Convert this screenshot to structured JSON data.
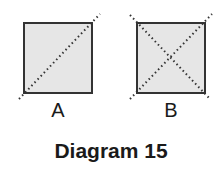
{
  "diagram": {
    "title": "Diagram 15",
    "figures": [
      {
        "label": "A",
        "shape": "square",
        "fill": "#e6e6e6",
        "stroke": "#333333",
        "dotted_lines": [
          "diagonal bottom-left to top-right"
        ]
      },
      {
        "label": "B",
        "shape": "square",
        "fill": "#e6e6e6",
        "stroke": "#333333",
        "dotted_lines": [
          "diagonal top-left to bottom-right",
          "diagonal bottom-left to top-right"
        ]
      }
    ]
  }
}
